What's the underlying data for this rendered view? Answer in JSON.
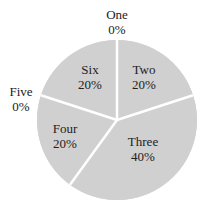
{
  "chart_data": {
    "type": "pie",
    "title": "",
    "start_angle_deg": 0,
    "direction": "clockwise",
    "slice_color": "#d0d0d0",
    "separator_color": "#ffffff",
    "categories": [
      "One",
      "Two",
      "Three",
      "Four",
      "Five",
      "Six"
    ],
    "values": [
      0,
      20,
      40,
      20,
      0,
      20
    ],
    "labels": [
      {
        "name": "One",
        "pct": "0%"
      },
      {
        "name": "Two",
        "pct": "20%"
      },
      {
        "name": "Three",
        "pct": "40%"
      },
      {
        "name": "Four",
        "pct": "20%"
      },
      {
        "name": "Five",
        "pct": "0%"
      },
      {
        "name": "Six",
        "pct": "20%"
      }
    ],
    "legend": "none"
  }
}
